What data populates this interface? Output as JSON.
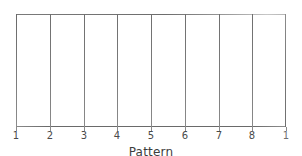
{
  "figure": {
    "background_color": "#ffffff",
    "line_color": "#6d6d6d",
    "text_color": "#4a4a4a"
  },
  "chart_data": {
    "type": "bar",
    "title": "",
    "subtitle": "",
    "xlabel": "Pattern",
    "ylabel": "",
    "categories": [
      "1",
      "2",
      "3",
      "4",
      "5",
      "6",
      "7",
      "8"
    ],
    "values": [
      0,
      0,
      0,
      0,
      0,
      0,
      0,
      0
    ],
    "series": [
      {
        "name": "Pattern",
        "values": [
          0,
          0,
          0,
          0,
          0,
          0,
          0,
          0
        ]
      }
    ],
    "xtick_labels": [
      "1",
      "2",
      "3",
      "4",
      "5",
      "6",
      "7",
      "8",
      "1"
    ],
    "xtick_positions": [
      0,
      1,
      2,
      3,
      4,
      5,
      6,
      7,
      8
    ],
    "ytick_labels": [],
    "xlim": [
      0,
      8
    ],
    "ylim": [
      0,
      1
    ],
    "grid": false,
    "legend": false,
    "legend_position": "none",
    "annotations": []
  },
  "axis": {
    "title": "Pattern",
    "title_underlined": true
  },
  "ticks": {
    "labels": [
      "1",
      "2",
      "3",
      "4",
      "5",
      "6",
      "7",
      "8",
      "1"
    ]
  },
  "columns": {
    "count": 8,
    "labels": [
      "1",
      "2",
      "3",
      "4",
      "5",
      "6",
      "7",
      "8"
    ]
  }
}
